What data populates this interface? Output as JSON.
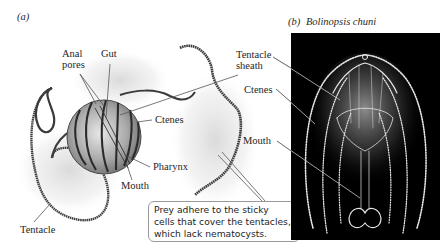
{
  "panel_a": {
    "label": "(a)",
    "labels": {
      "anal_pores_line1": "Anal",
      "anal_pores_line2": "pores",
      "gut": "Gut",
      "tentacle_sheath_line1": "Tentacle",
      "tentacle_sheath_line2": "sheath",
      "ctenes": "Ctenes",
      "pharynx": "Pharynx",
      "mouth": "Mouth",
      "tentacle": "Tentacle"
    },
    "callout": {
      "line1": "Prey adhere to the sticky",
      "line2": "cells that cover the tentacles,",
      "line3": "which lack nematocysts."
    }
  },
  "panel_b": {
    "label": "(b)",
    "species": "Bolinopsis chuni",
    "labels": {
      "tentacle_sheath_line1": "Tentacle",
      "tentacle_sheath_line2": "sheath",
      "ctenes": "Ctenes",
      "mouth": "Mouth"
    }
  },
  "colors": {
    "photo_background": "#000000",
    "leader_line": "#555555",
    "callout_border": "#9a9a9a"
  }
}
